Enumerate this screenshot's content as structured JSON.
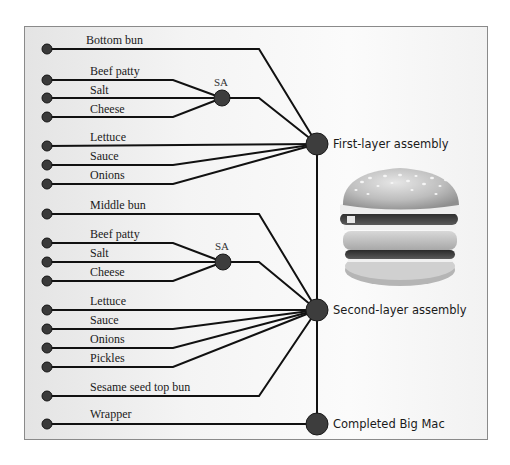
{
  "diagram": {
    "first_group": {
      "bottom_bun": "Bottom bun",
      "subassembly": {
        "label": "SA",
        "inputs": [
          "Beef patty",
          "Salt",
          "Cheese"
        ]
      },
      "toppings": [
        "Lettuce",
        "Sauce",
        "Onions"
      ],
      "assembly_label": "First-layer assembly"
    },
    "second_group": {
      "middle_bun": "Middle bun",
      "subassembly": {
        "label": "SA",
        "inputs": [
          "Beef patty",
          "Salt",
          "Cheese"
        ]
      },
      "toppings": [
        "Lettuce",
        "Sauce",
        "Onions",
        "Pickles"
      ],
      "top_bun": "Sesame seed top bun",
      "assembly_label": "Second-layer assembly"
    },
    "final": {
      "input": "Wrapper",
      "label": "Completed Big Mac"
    },
    "image": {
      "name": "big-mac-burger-illustration"
    },
    "colors": {
      "line": "#111111",
      "node": "#3d3d3d",
      "background_left": "#e4e4e4",
      "background_right": "#fbfbfb",
      "border": "#8a8a8a"
    }
  }
}
